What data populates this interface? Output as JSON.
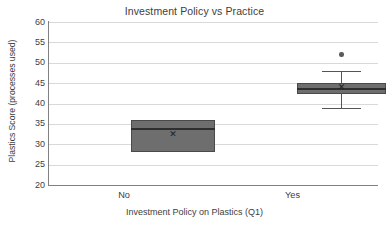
{
  "chart_data": {
    "type": "box",
    "title": "Investment Policy vs Practice",
    "xlabel": "Investment Policy on Plastics (Q1)",
    "ylabel": "Plastics Score (processes used)",
    "categories": [
      "No",
      "Yes"
    ],
    "ylim": [
      20,
      60
    ],
    "yticks": [
      60,
      55,
      50,
      45,
      40,
      35,
      30,
      25,
      20
    ],
    "grid": true,
    "legend": "none",
    "series": [
      {
        "name": "No",
        "min": 28,
        "q1": 28,
        "median": 34,
        "q3": 36,
        "max": 36,
        "mean": 32.3,
        "outliers": []
      },
      {
        "name": "Yes",
        "min": 39,
        "q1": 42.3,
        "median": 43.7,
        "q3": 45,
        "max": 48,
        "mean": 44,
        "outliers": [
          52
        ]
      }
    ],
    "colors": {
      "box_fill": "#6e6e6e",
      "box_edge": "#4a4a4a",
      "median": "#2e2e2e",
      "whisker": "#555555",
      "outlier": "#5a5a5a",
      "grid": "#d9d9d9",
      "axis": "#808080",
      "text": "#404040",
      "background": "#ffffff"
    }
  }
}
